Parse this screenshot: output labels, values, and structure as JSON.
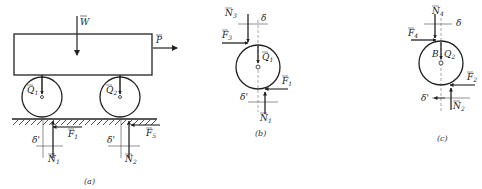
{
  "figures": [
    {
      "id": "a",
      "caption": "(a)",
      "labels": {
        "W": "W",
        "P": "P",
        "Q1": "Q",
        "Q1_sub": "1",
        "Q2": "Q",
        "Q2_sub": "2",
        "F1": "F",
        "F1_sub": "1",
        "F5": "F",
        "F5_sub": "5",
        "N1": "N",
        "N1_sub": "1",
        "N2": "N",
        "N2_sub": "2",
        "delta1": "δ'",
        "delta2": "δ'"
      }
    },
    {
      "id": "b",
      "caption": "(b)",
      "labels": {
        "N3": "N",
        "N3_sub": "3",
        "delta": "δ",
        "F3": "F",
        "F3_sub": "3",
        "Q1": "Q",
        "Q1_sub": "1",
        "F1": "F",
        "F1_sub": "1",
        "delta_prime": "δ'",
        "N1": "N",
        "N1_sub": "1"
      }
    },
    {
      "id": "c",
      "caption": "(c)",
      "labels": {
        "N4": "N",
        "N4_sub": "4",
        "delta": "δ",
        "F4": "F",
        "F4_sub": "4",
        "B": "B",
        "Q2": "Q",
        "Q2_sub": "2",
        "F2": "F",
        "F2_sub": "2",
        "delta_prime": "δ'",
        "N2": "N",
        "N2_sub": "2"
      }
    }
  ],
  "colors": {
    "ink": "#222222",
    "background": "#ffffff"
  }
}
